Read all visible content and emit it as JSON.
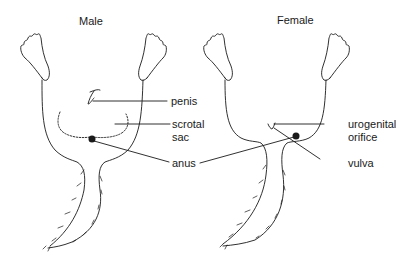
{
  "diagrams": [
    {
      "title": "Male",
      "labels": {
        "penis": "penis",
        "scrotal_sac_line1": "scrotal",
        "scrotal_sac_line2": "sac",
        "anus": "anus"
      }
    },
    {
      "title": "Female",
      "labels": {
        "urogenital_orifice_line1": "urogenital",
        "urogenital_orifice_line2": "orifice",
        "vulva": "vulva"
      }
    }
  ],
  "colors": {
    "line": "#1a1a1a",
    "background": "#ffffff"
  }
}
